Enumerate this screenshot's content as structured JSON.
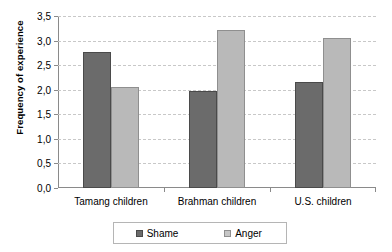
{
  "chart_data": {
    "type": "bar",
    "title": "",
    "xlabel": "",
    "ylabel": "Frequency of experience",
    "categories": [
      "Tamang children",
      "Brahman children",
      "U.S. children"
    ],
    "series": [
      {
        "name": "Shame",
        "color": "#6b6b6b",
        "values": [
          2.77,
          1.97,
          2.15
        ]
      },
      {
        "name": "Anger",
        "color": "#b9b9b9",
        "values": [
          2.05,
          3.22,
          3.05
        ]
      }
    ],
    "ylim": [
      0.0,
      3.5
    ],
    "ytick_values": [
      0.0,
      0.5,
      1.0,
      1.5,
      2.0,
      2.5,
      3.0,
      3.5
    ],
    "ytick_labels": [
      "0,0",
      "0,5",
      "1,0",
      "1,5",
      "2,0",
      "2,5",
      "3,0",
      "3,5"
    ],
    "decimal_separator": ",",
    "grid": "horizontal-dashed",
    "legend_position": "bottom",
    "legend_entries": [
      "Shame",
      "Anger"
    ]
  }
}
